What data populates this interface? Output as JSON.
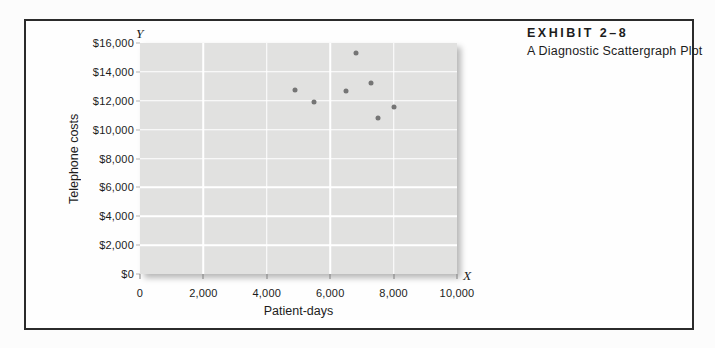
{
  "exhibit": {
    "label": "EXHIBIT 2–8",
    "caption": "A Diagnostic Scattergraph Plot"
  },
  "chart_data": {
    "type": "scatter",
    "title": "EXHIBIT 2–8",
    "subtitle": "A Diagnostic Scattergraph Plot",
    "xlabel": "Patient-days",
    "ylabel": "Telephone costs",
    "x_axis_letter": "X",
    "y_axis_letter": "Y",
    "xlim": [
      0,
      10000
    ],
    "ylim": [
      0,
      16000
    ],
    "x_ticks": [
      0,
      2000,
      4000,
      6000,
      8000,
      10000
    ],
    "x_tick_labels": [
      "0",
      "2,000",
      "4,000",
      "6,000",
      "8,000",
      "10,000"
    ],
    "y_ticks": [
      0,
      2000,
      4000,
      6000,
      8000,
      10000,
      12000,
      14000,
      16000
    ],
    "y_tick_labels": [
      "$0",
      "$2,000",
      "$4,000",
      "$6,000",
      "$8,000",
      "$10,000",
      "$12,000",
      "$14,000",
      "$16,000"
    ],
    "grid": true,
    "legend": false,
    "points": [
      {
        "x": 4900,
        "y": 12750
      },
      {
        "x": 5500,
        "y": 11900
      },
      {
        "x": 6500,
        "y": 12700
      },
      {
        "x": 6800,
        "y": 15300
      },
      {
        "x": 7300,
        "y": 13250
      },
      {
        "x": 7500,
        "y": 10800
      },
      {
        "x": 8000,
        "y": 11550
      }
    ],
    "colors": {
      "plot_bg": "#e1e1e0",
      "grid": "#ffffff",
      "point": "#757575",
      "frame_border": "#2b2b2b"
    }
  }
}
